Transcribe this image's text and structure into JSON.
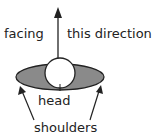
{
  "labels": {
    "facing": "facing",
    "direction": "this direction",
    "head": "head",
    "shoulders": "shoulders"
  },
  "colors": {
    "shoulders_fill": "#8a8a8a",
    "head_fill": "#ffffff",
    "stroke": "#222222"
  }
}
